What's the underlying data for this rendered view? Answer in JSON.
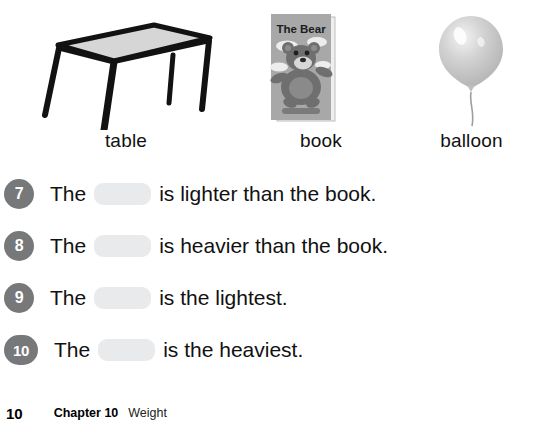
{
  "objects": [
    {
      "label": "table",
      "icon": "table-illustration"
    },
    {
      "label": "book",
      "icon": "book-illustration",
      "cover_title": "The Bear"
    },
    {
      "label": "balloon",
      "icon": "balloon-illustration"
    }
  ],
  "questions": [
    {
      "number": "7",
      "text_before": "The",
      "text_after": "is lighter than the book."
    },
    {
      "number": "8",
      "text_before": "The",
      "text_after": "is heavier than the book."
    },
    {
      "number": "9",
      "text_before": "The",
      "text_after": "is the lightest."
    },
    {
      "number": "10",
      "text_before": "The",
      "text_after": "is the heaviest."
    }
  ],
  "footer": {
    "page_number": "10",
    "chapter": "Chapter 10",
    "topic": "Weight"
  },
  "colors": {
    "badge_gray": "#77787a",
    "blank_gray": "#e9eaec",
    "text_black": "#111111",
    "table_top": "#d6d6d6",
    "book_cover": "#a8a8a8",
    "balloon_gray": "#c9c9c9"
  }
}
